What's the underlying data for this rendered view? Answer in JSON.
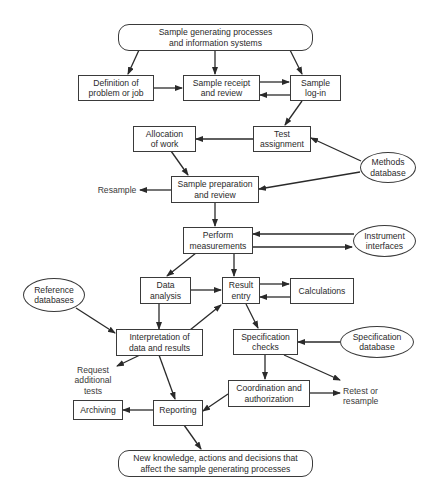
{
  "diagram": {
    "type": "flowchart",
    "nodes": {
      "source": {
        "label": "Sample generating processes\nand information systems",
        "shape": "rounded"
      },
      "definition": {
        "label": "Definition of\nproblem or job",
        "shape": "box"
      },
      "receipt": {
        "label": "Sample receipt\nand review",
        "shape": "box"
      },
      "login": {
        "label": "Sample\nlog-in",
        "shape": "box"
      },
      "allocation": {
        "label": "Allocation\nof work",
        "shape": "box"
      },
      "test_assignment": {
        "label": "Test\nassignment",
        "shape": "box"
      },
      "methods_db": {
        "label": "Methods\ndatabase",
        "shape": "ellipse"
      },
      "sample_prep": {
        "label": "Sample preparation\nand review",
        "shape": "box"
      },
      "perform": {
        "label": "Perform\nmeasurements",
        "shape": "box"
      },
      "instrument": {
        "label": "Instrument\ninterfaces",
        "shape": "ellipse"
      },
      "data_analysis": {
        "label": "Data\nanalysis",
        "shape": "box"
      },
      "result_entry": {
        "label": "Result\nentry",
        "shape": "box"
      },
      "calculations": {
        "label": "Calculations",
        "shape": "box"
      },
      "reference_db": {
        "label": "Reference\ndatabases",
        "shape": "ellipse"
      },
      "interpretation": {
        "label": "Interpretation of\ndata and results",
        "shape": "box"
      },
      "spec_checks": {
        "label": "Specification\nchecks",
        "shape": "box"
      },
      "spec_db": {
        "label": "Specification\ndatabase",
        "shape": "ellipse"
      },
      "coordination": {
        "label": "Coordination and\nauthorization",
        "shape": "box"
      },
      "reporting": {
        "label": "Reporting",
        "shape": "box"
      },
      "archiving": {
        "label": "Archiving",
        "shape": "box"
      },
      "outcome": {
        "label": "New knowledge, actions and decisions that\naffect the sample generating processes",
        "shape": "rounded"
      }
    },
    "terminals": {
      "resample": "Resample",
      "request_tests": "Request\nadditional\ntests",
      "retest": "Retest or\nresample"
    },
    "edges": [
      [
        "source",
        "definition"
      ],
      [
        "source",
        "receipt"
      ],
      [
        "source",
        "login"
      ],
      [
        "definition",
        "receipt"
      ],
      [
        "receipt",
        "login"
      ],
      [
        "login",
        "receipt"
      ],
      [
        "login",
        "test_assignment"
      ],
      [
        "test_assignment",
        "allocation"
      ],
      [
        "methods_db",
        "test_assignment"
      ],
      [
        "methods_db",
        "sample_prep"
      ],
      [
        "allocation",
        "sample_prep"
      ],
      [
        "sample_prep",
        "resample"
      ],
      [
        "sample_prep",
        "perform"
      ],
      [
        "instrument",
        "perform"
      ],
      [
        "perform",
        "instrument"
      ],
      [
        "perform",
        "data_analysis"
      ],
      [
        "perform",
        "result_entry"
      ],
      [
        "data_analysis",
        "result_entry"
      ],
      [
        "result_entry",
        "calculations"
      ],
      [
        "calculations",
        "result_entry"
      ],
      [
        "data_analysis",
        "interpretation"
      ],
      [
        "reference_db",
        "interpretation"
      ],
      [
        "interpretation",
        "result_entry"
      ],
      [
        "result_entry",
        "spec_checks"
      ],
      [
        "spec_db",
        "spec_checks"
      ],
      [
        "spec_checks",
        "retest"
      ],
      [
        "spec_checks",
        "coordination"
      ],
      [
        "coordination",
        "retest"
      ],
      [
        "coordination",
        "reporting"
      ],
      [
        "interpretation",
        "request_tests"
      ],
      [
        "interpretation",
        "reporting"
      ],
      [
        "reporting",
        "archiving"
      ],
      [
        "reporting",
        "outcome"
      ]
    ],
    "colors": {
      "line": "#2a2a2a",
      "background": "#ffffff"
    }
  }
}
